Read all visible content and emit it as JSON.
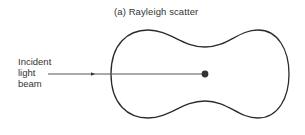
{
  "figure": {
    "panel_label": "(a)",
    "title": "(a)  Rayleigh scatter",
    "beam_label_lines": [
      "Incident",
      "light",
      "beam"
    ],
    "colors": {
      "stroke": "#2b2b2b",
      "beam": "#555555",
      "particle": "#333333",
      "background": "#ffffff"
    },
    "elements": {
      "scattering_pattern": "dumbbell-shaped polar intensity contour (symmetric, forward/backward lobes)",
      "particle": "small scattering particle at center",
      "incident_beam": "horizontal line with arrowhead pointing toward particle"
    }
  }
}
